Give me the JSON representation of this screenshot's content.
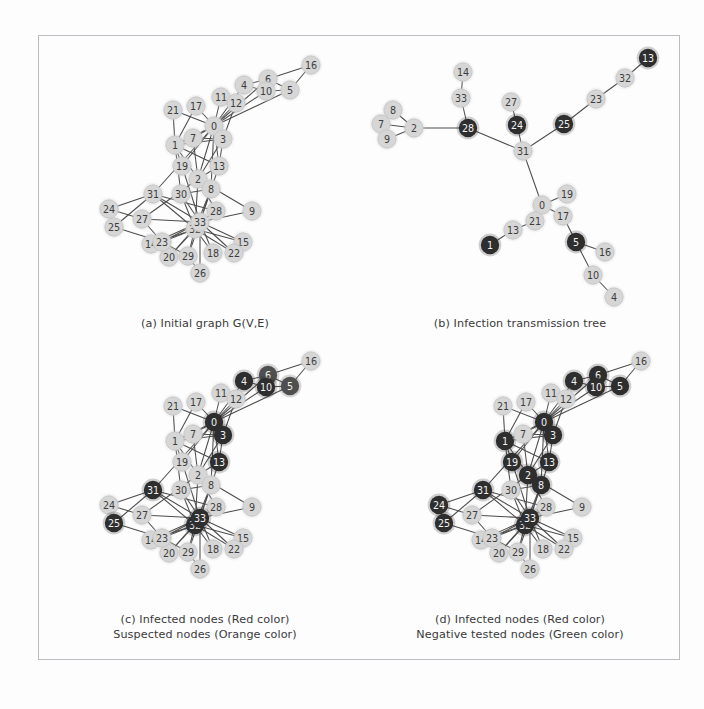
{
  "figure": {
    "title_present": false,
    "background": "#fdfdfd",
    "frame_color": "#b9bcc0",
    "palette": {
      "light_node": "#d6d6d6",
      "light_node_stroke": "#c2c2c2",
      "dark_node_red": "#2e2e2e",
      "dark_node_orange": "#4f4f4f",
      "dark_node_green": "#3a3a3a",
      "edge": "#4c4c4c",
      "dark_label": "#f2f2f2",
      "light_label": "#3d3d3d"
    }
  },
  "captions": {
    "a": "(a) Initial graph G(V,E)",
    "b": "(b) Infection transmission tree",
    "c": "(c) Infected nodes (Red color)\nSuspected nodes (Orange color)",
    "d": "(d) Infected nodes (Red color)\nNegative tested nodes (Green color)"
  },
  "chart_data": {
    "type": "diagram",
    "graph_nodes": [
      "0",
      "1",
      "2",
      "3",
      "4",
      "5",
      "6",
      "7",
      "8",
      "9",
      "10",
      "11",
      "12",
      "13",
      "14",
      "15",
      "16",
      "17",
      "18",
      "19",
      "20",
      "21",
      "22",
      "23",
      "24",
      "25",
      "26",
      "27",
      "28",
      "29",
      "30",
      "31",
      "32",
      "33"
    ],
    "panel_a": {
      "label": "(a) Initial graph G(V,E)",
      "node_positions": {
        "0": [
          176,
          91
        ],
        "1": [
          137,
          110
        ],
        "2": [
          160,
          144
        ],
        "3": [
          185,
          104
        ],
        "4": [
          206,
          50
        ],
        "5": [
          252,
          55
        ],
        "6": [
          230,
          44
        ],
        "7": [
          155,
          103
        ],
        "8": [
          173,
          154
        ],
        "9": [
          214,
          176
        ],
        "10": [
          228,
          56
        ],
        "11": [
          183,
          62
        ],
        "12": [
          198,
          68
        ],
        "13": [
          181,
          131
        ],
        "14": [
          113,
          209
        ],
        "15": [
          205,
          207
        ],
        "16": [
          273,
          30
        ],
        "17": [
          158,
          71
        ],
        "18": [
          175,
          218
        ],
        "19": [
          144,
          131
        ],
        "20": [
          131,
          222
        ],
        "21": [
          135,
          75
        ],
        "22": [
          196,
          218
        ],
        "23": [
          124,
          207
        ],
        "24": [
          71,
          174
        ],
        "25": [
          76,
          192
        ],
        "26": [
          162,
          238
        ],
        "27": [
          104,
          184
        ],
        "28": [
          178,
          176
        ],
        "29": [
          150,
          221
        ],
        "30": [
          143,
          159
        ],
        "31": [
          115,
          159
        ],
        "32": [
          157,
          194
        ],
        "33": [
          162,
          187
        ]
      },
      "dark_nodes": []
    },
    "panel_b": {
      "label": "(b) Infection transmission tree",
      "tree_edges": [
        [
          "2",
          "7"
        ],
        [
          "2",
          "8"
        ],
        [
          "2",
          "9"
        ],
        [
          "7",
          "8"
        ],
        [
          "7",
          "9"
        ],
        [
          "2",
          "28"
        ],
        [
          "28",
          "33"
        ],
        [
          "33",
          "14"
        ],
        [
          "28",
          "31"
        ],
        [
          "31",
          "24"
        ],
        [
          "24",
          "27"
        ],
        [
          "31",
          "25"
        ],
        [
          "25",
          "23"
        ],
        [
          "23",
          "32"
        ],
        [
          "32",
          "13t"
        ],
        [
          "31",
          "0"
        ],
        [
          "0",
          "19"
        ],
        [
          "0",
          "17"
        ],
        [
          "0",
          "21"
        ],
        [
          "21",
          "13"
        ],
        [
          "13",
          "1"
        ],
        [
          "17",
          "5"
        ],
        [
          "5",
          "16"
        ],
        [
          "5",
          "10"
        ],
        [
          "10",
          "4"
        ]
      ],
      "node_positions": {
        "14": [
          463,
          72
        ],
        "33": [
          461,
          98
        ],
        "8": [
          393,
          110
        ],
        "7": [
          381,
          124
        ],
        "9": [
          387,
          139
        ],
        "2": [
          414,
          128
        ],
        "28": [
          468,
          128
        ],
        "27": [
          511,
          102
        ],
        "24": [
          517,
          125
        ],
        "31": [
          523,
          151
        ],
        "25": [
          564,
          124
        ],
        "23": [
          596,
          99
        ],
        "32": [
          625,
          78
        ],
        "13t": [
          648,
          58
        ],
        "0": [
          542,
          205
        ],
        "19": [
          567,
          194
        ],
        "17": [
          563,
          216
        ],
        "21": [
          535,
          221
        ],
        "13": [
          513,
          230
        ],
        "1": [
          490,
          245
        ],
        "5": [
          576,
          242
        ],
        "16": [
          605,
          252
        ],
        "10": [
          593,
          275
        ],
        "4": [
          614,
          297
        ]
      },
      "dark_nodes": [
        "28",
        "24",
        "25",
        "13t",
        "5",
        "1"
      ]
    },
    "panel_c": {
      "label": "(c) Infected nodes (Red color)\nSuspected nodes (Orange color)",
      "offset": [
        0,
        296
      ],
      "red_nodes": [
        "0",
        "3",
        "4",
        "10",
        "13",
        "31",
        "32",
        "33",
        "25"
      ],
      "orange_nodes": [
        "5",
        "6"
      ]
    },
    "panel_d": {
      "label": "(d) Infected nodes (Red color)\nNegative tested nodes (Green color)",
      "offset": [
        330,
        296
      ],
      "red_nodes": [
        "0",
        "1",
        "2",
        "3",
        "4",
        "5",
        "6",
        "8",
        "10",
        "13",
        "19",
        "24",
        "25",
        "31",
        "32",
        "33"
      ],
      "green_nodes": []
    },
    "edges": [
      [
        "0",
        "1"
      ],
      [
        "0",
        "2"
      ],
      [
        "0",
        "3"
      ],
      [
        "0",
        "4"
      ],
      [
        "0",
        "5"
      ],
      [
        "0",
        "6"
      ],
      [
        "0",
        "7"
      ],
      [
        "0",
        "8"
      ],
      [
        "0",
        "10"
      ],
      [
        "0",
        "11"
      ],
      [
        "0",
        "12"
      ],
      [
        "0",
        "13"
      ],
      [
        "0",
        "17"
      ],
      [
        "0",
        "19"
      ],
      [
        "0",
        "21"
      ],
      [
        "0",
        "31"
      ],
      [
        "1",
        "2"
      ],
      [
        "1",
        "3"
      ],
      [
        "1",
        "7"
      ],
      [
        "1",
        "13"
      ],
      [
        "1",
        "17"
      ],
      [
        "1",
        "19"
      ],
      [
        "1",
        "21"
      ],
      [
        "1",
        "30"
      ],
      [
        "2",
        "3"
      ],
      [
        "2",
        "7"
      ],
      [
        "2",
        "8"
      ],
      [
        "2",
        "9"
      ],
      [
        "2",
        "13"
      ],
      [
        "2",
        "27"
      ],
      [
        "2",
        "28"
      ],
      [
        "2",
        "32"
      ],
      [
        "3",
        "7"
      ],
      [
        "3",
        "12"
      ],
      [
        "3",
        "13"
      ],
      [
        "4",
        "6"
      ],
      [
        "4",
        "10"
      ],
      [
        "5",
        "6"
      ],
      [
        "5",
        "10"
      ],
      [
        "5",
        "16"
      ],
      [
        "6",
        "16"
      ],
      [
        "8",
        "30"
      ],
      [
        "8",
        "32"
      ],
      [
        "8",
        "33"
      ],
      [
        "9",
        "33"
      ],
      [
        "13",
        "33"
      ],
      [
        "14",
        "32"
      ],
      [
        "14",
        "33"
      ],
      [
        "15",
        "32"
      ],
      [
        "15",
        "33"
      ],
      [
        "18",
        "32"
      ],
      [
        "18",
        "33"
      ],
      [
        "19",
        "33"
      ],
      [
        "20",
        "32"
      ],
      [
        "20",
        "33"
      ],
      [
        "22",
        "32"
      ],
      [
        "22",
        "33"
      ],
      [
        "23",
        "25"
      ],
      [
        "23",
        "27"
      ],
      [
        "23",
        "29"
      ],
      [
        "23",
        "32"
      ],
      [
        "23",
        "33"
      ],
      [
        "24",
        "25"
      ],
      [
        "24",
        "27"
      ],
      [
        "24",
        "31"
      ],
      [
        "25",
        "31"
      ],
      [
        "26",
        "29"
      ],
      [
        "26",
        "33"
      ],
      [
        "27",
        "33"
      ],
      [
        "28",
        "31"
      ],
      [
        "28",
        "33"
      ],
      [
        "29",
        "32"
      ],
      [
        "29",
        "33"
      ],
      [
        "30",
        "32"
      ],
      [
        "30",
        "33"
      ],
      [
        "31",
        "32"
      ],
      [
        "31",
        "33"
      ],
      [
        "32",
        "33"
      ]
    ]
  }
}
